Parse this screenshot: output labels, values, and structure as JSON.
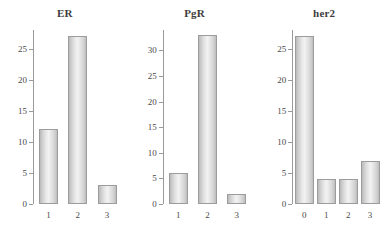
{
  "figure": {
    "background_color": "#ffffff",
    "bar_fill_color": "#e6e6e6",
    "bar_edge_color": "#9c9c9c",
    "axis_color": "#9a9a9a",
    "text_color": "#4a4a4a"
  },
  "chart_data": [
    {
      "type": "bar",
      "title": "ER",
      "xlabel": "",
      "ylabel": "",
      "categories": [
        "1",
        "2",
        "3"
      ],
      "values": [
        12,
        27,
        3
      ],
      "ylim": [
        0,
        28
      ],
      "yticks": [
        0,
        5,
        10,
        15,
        20,
        25
      ],
      "ytick_labels": [
        "0",
        "5",
        "10",
        "15",
        "20",
        "25"
      ],
      "grid": false,
      "legend": "none"
    },
    {
      "type": "bar",
      "title": "PgR",
      "xlabel": "",
      "ylabel": "",
      "categories": [
        "1",
        "2",
        "3"
      ],
      "values": [
        6,
        33,
        2
      ],
      "ylim": [
        0,
        34
      ],
      "yticks": [
        0,
        5,
        10,
        15,
        20,
        25,
        30
      ],
      "ytick_labels": [
        "0",
        "5",
        "10",
        "15",
        "20",
        "25",
        "30"
      ],
      "grid": false,
      "legend": "none"
    },
    {
      "type": "bar",
      "title": "her2",
      "xlabel": "",
      "ylabel": "",
      "categories": [
        "0",
        "1",
        "2",
        "3"
      ],
      "values": [
        27,
        4,
        4,
        7
      ],
      "ylim": [
        0,
        28
      ],
      "yticks": [
        0,
        5,
        10,
        15,
        20,
        25
      ],
      "ytick_labels": [
        "0",
        "5",
        "10",
        "15",
        "20",
        "25"
      ],
      "grid": false,
      "legend": "none"
    }
  ]
}
